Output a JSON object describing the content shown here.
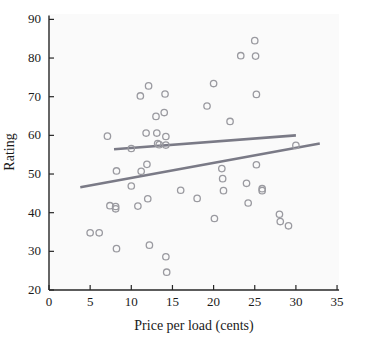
{
  "chart_data": {
    "type": "scatter",
    "title": "",
    "xlabel": "Price per load (cents)",
    "ylabel": "Rating",
    "xlim": [
      0,
      35
    ],
    "ylim": [
      20,
      90
    ],
    "xticks": [
      0,
      5,
      10,
      15,
      20,
      25,
      30,
      35
    ],
    "yticks": [
      20,
      30,
      40,
      50,
      60,
      70,
      80,
      90
    ],
    "grid": false,
    "legend": "none",
    "marker": "open-circle",
    "marker_color": "#9a9aa0",
    "line_color": "#7a7a86",
    "points": [
      {
        "x": 5.0,
        "y": 34.8
      },
      {
        "x": 6.1,
        "y": 34.8
      },
      {
        "x": 7.1,
        "y": 59.8
      },
      {
        "x": 7.4,
        "y": 41.8
      },
      {
        "x": 8.1,
        "y": 41.6
      },
      {
        "x": 8.1,
        "y": 41.0
      },
      {
        "x": 8.2,
        "y": 50.8
      },
      {
        "x": 8.2,
        "y": 30.7
      },
      {
        "x": 10.0,
        "y": 56.6
      },
      {
        "x": 10.0,
        "y": 46.9
      },
      {
        "x": 10.8,
        "y": 41.7
      },
      {
        "x": 11.1,
        "y": 70.2
      },
      {
        "x": 11.2,
        "y": 50.7
      },
      {
        "x": 11.8,
        "y": 60.6
      },
      {
        "x": 11.9,
        "y": 52.5
      },
      {
        "x": 12.0,
        "y": 43.6
      },
      {
        "x": 12.1,
        "y": 72.8
      },
      {
        "x": 12.2,
        "y": 31.6
      },
      {
        "x": 13.0,
        "y": 64.9
      },
      {
        "x": 13.1,
        "y": 60.6
      },
      {
        "x": 13.2,
        "y": 57.9
      },
      {
        "x": 13.4,
        "y": 57.6
      },
      {
        "x": 14.0,
        "y": 65.9
      },
      {
        "x": 14.1,
        "y": 70.7
      },
      {
        "x": 14.2,
        "y": 59.7
      },
      {
        "x": 14.2,
        "y": 57.5
      },
      {
        "x": 14.2,
        "y": 28.6
      },
      {
        "x": 14.3,
        "y": 24.6
      },
      {
        "x": 16.0,
        "y": 45.8
      },
      {
        "x": 18.0,
        "y": 43.7
      },
      {
        "x": 19.2,
        "y": 67.6
      },
      {
        "x": 20.0,
        "y": 73.4
      },
      {
        "x": 20.1,
        "y": 38.5
      },
      {
        "x": 21.0,
        "y": 51.4
      },
      {
        "x": 21.1,
        "y": 48.8
      },
      {
        "x": 21.2,
        "y": 45.7
      },
      {
        "x": 22.0,
        "y": 63.6
      },
      {
        "x": 23.3,
        "y": 80.6
      },
      {
        "x": 24.0,
        "y": 47.6
      },
      {
        "x": 24.2,
        "y": 42.5
      },
      {
        "x": 25.0,
        "y": 84.5
      },
      {
        "x": 25.1,
        "y": 80.5
      },
      {
        "x": 25.2,
        "y": 70.6
      },
      {
        "x": 25.2,
        "y": 52.4
      },
      {
        "x": 25.9,
        "y": 46.2
      },
      {
        "x": 25.9,
        "y": 45.7
      },
      {
        "x": 28.0,
        "y": 39.6
      },
      {
        "x": 28.1,
        "y": 37.7
      },
      {
        "x": 29.1,
        "y": 36.6
      },
      {
        "x": 30.0,
        "y": 57.4
      }
    ],
    "lines": [
      {
        "name": "upper-trend-line",
        "x1": 7.9,
        "y1": 56.4,
        "x2": 30.0,
        "y2": 60.0
      },
      {
        "name": "lower-trend-line",
        "x1": 3.8,
        "y1": 46.6,
        "x2": 32.9,
        "y2": 57.9
      }
    ]
  },
  "axes": {
    "x_title": "Price per load (cents)",
    "y_title": "Rating",
    "x_tick_labels": [
      "0",
      "5",
      "10",
      "15",
      "20",
      "25",
      "30",
      "35"
    ],
    "y_tick_labels": [
      "20",
      "30",
      "40",
      "50",
      "60",
      "70",
      "80",
      "90"
    ]
  }
}
